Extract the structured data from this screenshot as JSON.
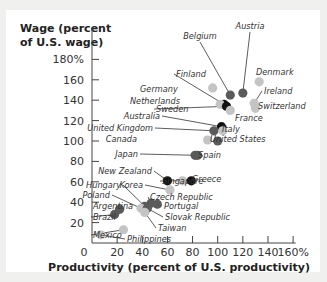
{
  "chart_data": {
    "type": "scatter",
    "title": "",
    "ylabel_lines": [
      "Wage (percent",
      "of U.S. wage)"
    ],
    "xlabel": "Productivity (percent of U.S. productivity)",
    "xlim": [
      0,
      160
    ],
    "ylim": [
      0,
      180
    ],
    "x_ticks": [
      "0",
      "20",
      "40",
      "60",
      "80",
      "100",
      "120",
      "140",
      "160%"
    ],
    "y_ticks": [
      "20",
      "40",
      "60",
      "80",
      "100",
      "120",
      "140",
      "160",
      "180%"
    ],
    "grid": false,
    "legend": null,
    "points": [
      {
        "country": "Austria",
        "x": 120,
        "y": 147,
        "shade": "dark"
      },
      {
        "country": "Belgium",
        "x": 110,
        "y": 145,
        "shade": "dark"
      },
      {
        "country": "Denmark",
        "x": 133,
        "y": 158,
        "shade": "light"
      },
      {
        "country": "Finland",
        "x": 105,
        "y": 136,
        "shade": "black"
      },
      {
        "country": "Germany",
        "x": 96,
        "y": 152,
        "shade": "light"
      },
      {
        "country": "Ireland",
        "x": 129,
        "y": 137,
        "shade": "light"
      },
      {
        "country": "Netherlands",
        "x": 102,
        "y": 136,
        "shade": "light"
      },
      {
        "country": "Switzerland",
        "x": 130,
        "y": 132,
        "shade": "light"
      },
      {
        "country": "Sweden",
        "x": 107,
        "y": 134,
        "shade": "black"
      },
      {
        "country": "France",
        "x": 110,
        "y": 130,
        "shade": "light"
      },
      {
        "country": "Australia",
        "x": 103,
        "y": 114,
        "shade": "black"
      },
      {
        "country": "United Kingdom",
        "x": 97,
        "y": 110,
        "shade": "dark"
      },
      {
        "country": "Italy",
        "x": 104,
        "y": 110,
        "shade": "light"
      },
      {
        "country": "Canada",
        "x": 92,
        "y": 101,
        "shade": "light"
      },
      {
        "country": "United States",
        "x": 100,
        "y": 100,
        "shade": "dark"
      },
      {
        "country": "Japan",
        "x": 82,
        "y": 86,
        "shade": "dark"
      },
      {
        "country": "Spain",
        "x": 84,
        "y": 86,
        "shade": "dark"
      },
      {
        "country": "New Zealand",
        "x": 60,
        "y": 61,
        "shade": "black"
      },
      {
        "country": "Singapore",
        "x": 72,
        "y": 61,
        "shade": "light"
      },
      {
        "country": "Greece",
        "x": 79,
        "y": 61,
        "shade": "black"
      },
      {
        "country": "Korea",
        "x": 62,
        "y": 52,
        "shade": "light"
      },
      {
        "country": "Hungary",
        "x": 42,
        "y": 36,
        "shade": "dark"
      },
      {
        "country": "Poland",
        "x": 39,
        "y": 34,
        "shade": "light"
      },
      {
        "country": "Czech Republic",
        "x": 47,
        "y": 39,
        "shade": "dark"
      },
      {
        "country": "Portugal",
        "x": 52,
        "y": 38,
        "shade": "dark"
      },
      {
        "country": "Slovak Republic",
        "x": 44,
        "y": 34,
        "shade": "dark"
      },
      {
        "country": "Taiwan",
        "x": 42,
        "y": 30,
        "shade": "light"
      },
      {
        "country": "Argentina",
        "x": 22,
        "y": 33,
        "shade": "dark"
      },
      {
        "country": "Brazil",
        "x": 18,
        "y": 28,
        "shade": "dark"
      },
      {
        "country": "Mexico",
        "x": 25,
        "y": 13,
        "shade": "light"
      },
      {
        "country": "Philippines",
        "x": 7,
        "y": 8,
        "shade": "light"
      }
    ]
  },
  "colors": {
    "black": "#111111",
    "dark": "#5a5a5a",
    "light": "#c4c4c4",
    "axis": "#444444",
    "background": "#ffffff"
  }
}
